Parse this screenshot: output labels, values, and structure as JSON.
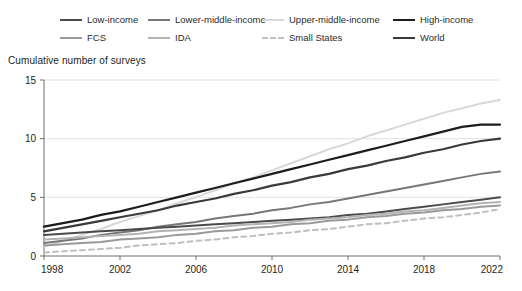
{
  "legend": {
    "rows": [
      [
        {
          "label": "Low-income",
          "color": "#4a4a4a",
          "dashed": false,
          "x": 60,
          "y": 14
        },
        {
          "label": "Lower-middle-income",
          "color": "#777777",
          "dashed": false,
          "x": 148,
          "y": 14
        },
        {
          "label": "Upper-middle-income",
          "color": "#d8d8d8",
          "dashed": false,
          "x": 262,
          "y": 14
        },
        {
          "label": "High-income",
          "color": "#1c1c1c",
          "dashed": false,
          "x": 393,
          "y": 14
        }
      ],
      [
        {
          "label": "FCS",
          "color": "#9a9a9a",
          "dashed": false,
          "x": 60,
          "y": 32
        },
        {
          "label": "IDA",
          "color": "#b3b3b3",
          "dashed": false,
          "x": 148,
          "y": 32
        },
        {
          "label": "Small States",
          "color": "#bfbfbf",
          "dashed": true,
          "x": 262,
          "y": 32
        },
        {
          "label": "World",
          "color": "#3a3a3a",
          "dashed": false,
          "x": 393,
          "y": 32
        }
      ]
    ]
  },
  "axis_title": "Cumulative number of surveys",
  "chart_data": {
    "type": "line",
    "title": "",
    "subtitle": "",
    "xlabel": "",
    "ylabel": "Cumulative number of surveys",
    "xlim": [
      1998,
      2022
    ],
    "ylim": [
      0,
      15
    ],
    "xticks": [
      1998,
      2002,
      2006,
      2010,
      2014,
      2018,
      2022
    ],
    "yticks": [
      0,
      5,
      10,
      15
    ],
    "grid": "horizontal",
    "legend_position": "top",
    "x": [
      1998,
      1999,
      2000,
      2001,
      2002,
      2003,
      2004,
      2005,
      2006,
      2007,
      2008,
      2009,
      2010,
      2011,
      2012,
      2013,
      2014,
      2015,
      2016,
      2017,
      2018,
      2019,
      2020,
      2021,
      2022
    ],
    "series": [
      {
        "name": "Upper-middle-income",
        "color": "#d8d8d8",
        "dashed": false,
        "width": 2.0,
        "values": [
          0.8,
          1.3,
          1.8,
          2.3,
          2.9,
          3.4,
          3.9,
          4.5,
          5.0,
          5.6,
          6.2,
          6.7,
          7.3,
          7.9,
          8.5,
          9.1,
          9.6,
          10.2,
          10.7,
          11.2,
          11.7,
          12.2,
          12.6,
          13.0,
          13.3
        ]
      },
      {
        "name": "High-income",
        "color": "#1c1c1c",
        "dashed": false,
        "width": 2.2,
        "values": [
          2.5,
          2.8,
          3.1,
          3.5,
          3.8,
          4.2,
          4.6,
          5.0,
          5.4,
          5.8,
          6.2,
          6.6,
          7.0,
          7.4,
          7.8,
          8.2,
          8.6,
          9.0,
          9.4,
          9.8,
          10.2,
          10.6,
          11.0,
          11.2,
          11.2
        ]
      },
      {
        "name": "World",
        "color": "#3a3a3a",
        "dashed": false,
        "width": 2.2,
        "values": [
          2.1,
          2.4,
          2.7,
          3.0,
          3.3,
          3.6,
          3.9,
          4.3,
          4.6,
          4.9,
          5.3,
          5.6,
          6.0,
          6.3,
          6.7,
          7.0,
          7.4,
          7.7,
          8.1,
          8.4,
          8.8,
          9.1,
          9.5,
          9.8,
          10.0
        ]
      },
      {
        "name": "Lower-middle-income",
        "color": "#777777",
        "dashed": false,
        "width": 2.0,
        "values": [
          1.1,
          1.3,
          1.5,
          1.8,
          2.0,
          2.2,
          2.5,
          2.7,
          2.9,
          3.2,
          3.4,
          3.6,
          3.9,
          4.1,
          4.4,
          4.6,
          4.9,
          5.2,
          5.5,
          5.8,
          6.1,
          6.4,
          6.7,
          7.0,
          7.2
        ]
      },
      {
        "name": "Low-income",
        "color": "#4a4a4a",
        "dashed": false,
        "width": 2.0,
        "values": [
          1.8,
          1.9,
          2.0,
          2.1,
          2.2,
          2.3,
          2.4,
          2.5,
          2.6,
          2.7,
          2.8,
          2.9,
          3.0,
          3.1,
          3.2,
          3.3,
          3.5,
          3.6,
          3.8,
          4.0,
          4.2,
          4.4,
          4.6,
          4.8,
          5.0
        ]
      },
      {
        "name": "IDA",
        "color": "#b3b3b3",
        "dashed": false,
        "width": 2.0,
        "values": [
          1.4,
          1.5,
          1.6,
          1.7,
          1.8,
          1.9,
          2.1,
          2.2,
          2.3,
          2.4,
          2.6,
          2.7,
          2.8,
          2.9,
          3.1,
          3.2,
          3.3,
          3.5,
          3.6,
          3.8,
          3.9,
          4.1,
          4.3,
          4.5,
          4.6
        ]
      },
      {
        "name": "FCS",
        "color": "#9a9a9a",
        "dashed": false,
        "width": 2.0,
        "values": [
          0.9,
          1.0,
          1.1,
          1.2,
          1.4,
          1.5,
          1.6,
          1.8,
          1.9,
          2.1,
          2.2,
          2.4,
          2.5,
          2.7,
          2.8,
          3.0,
          3.1,
          3.3,
          3.4,
          3.6,
          3.7,
          3.9,
          4.0,
          4.2,
          4.3
        ]
      },
      {
        "name": "Small States",
        "color": "#bfbfbf",
        "dashed": true,
        "width": 2.0,
        "values": [
          0.3,
          0.4,
          0.5,
          0.6,
          0.7,
          0.9,
          1.0,
          1.1,
          1.3,
          1.4,
          1.6,
          1.7,
          1.9,
          2.0,
          2.2,
          2.3,
          2.5,
          2.7,
          2.8,
          3.0,
          3.2,
          3.3,
          3.5,
          3.7,
          4.0
        ]
      }
    ]
  },
  "colors": {
    "axis": "#6f6f6f",
    "grid": "#e2e2e2",
    "text": "#231f20"
  }
}
